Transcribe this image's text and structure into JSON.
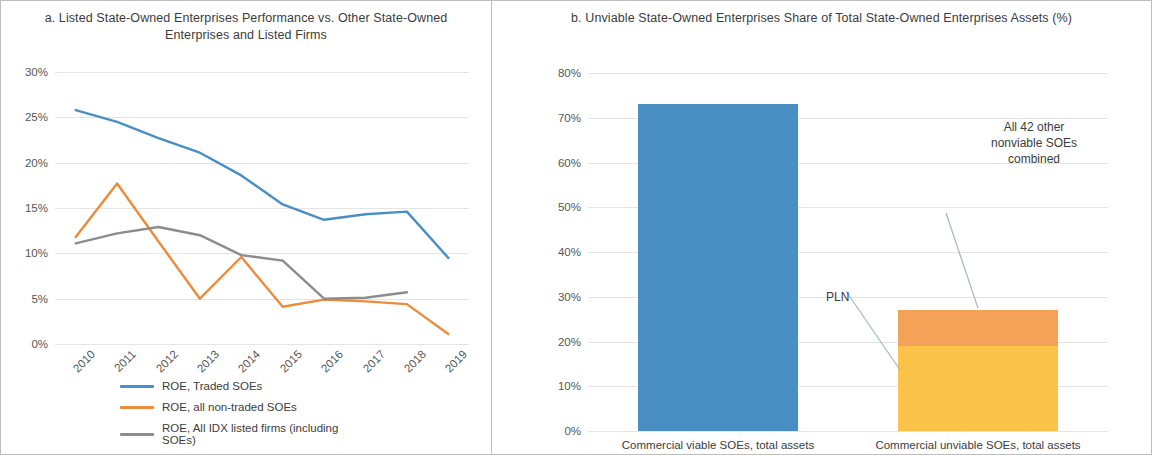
{
  "figure": {
    "panel_a_title": "a. Listed State-Owned Enterprises Performance vs. Other State-Owned Enterprises and Listed Firms",
    "panel_b_title": "b. Unviable State-Owned Enterprises Share of Total State-Owned Enterprises Assets (%)"
  },
  "colors": {
    "blue": "#4A8FC4",
    "orange": "#ED8B3C",
    "gray": "#8C8C8C",
    "bar_blue": "#4A8FC4",
    "bar_orange": "#F5A259",
    "bar_yellow": "#FBC34A",
    "gridline": "#E4E4E4",
    "border": "#BDBDBD",
    "text": "#3C3C3C"
  },
  "chart_data": [
    {
      "type": "line",
      "title": "a. Listed State-Owned Enterprises Performance vs. Other State-Owned Enterprises and Listed Firms",
      "xlabel": "",
      "ylabel": "",
      "ylim": [
        0,
        30
      ],
      "ytick_labels": [
        "0%",
        "5%",
        "10%",
        "15%",
        "20%",
        "25%",
        "30%"
      ],
      "ytick_values": [
        0,
        5,
        10,
        15,
        20,
        25,
        30
      ],
      "grid": true,
      "legend_position": "bottom",
      "categories": [
        "2010",
        "2011",
        "2012",
        "2013",
        "2014",
        "2015",
        "2016",
        "2017",
        "2018",
        "2019"
      ],
      "series": [
        {
          "name": "ROE, Traded SOEs",
          "color": "#4A8FC4",
          "values": [
            25.8,
            24.5,
            22.7,
            21.1,
            18.6,
            15.4,
            13.7,
            14.3,
            14.6,
            9.5
          ]
        },
        {
          "name": "ROE, all non-traded SOEs",
          "color": "#ED8B3C",
          "values": [
            11.8,
            17.7,
            11.3,
            5.0,
            9.6,
            4.1,
            4.9,
            4.7,
            4.4,
            1.1
          ]
        },
        {
          "name": "ROE, All IDX listed firms (including SOEs)",
          "color": "#8C8C8C",
          "values": [
            11.1,
            12.2,
            12.9,
            12.0,
            9.8,
            9.2,
            5.0,
            5.1,
            5.7,
            null
          ]
        }
      ]
    },
    {
      "type": "bar",
      "title": "b. Unviable State-Owned Enterprises Share of Total State-Owned Enterprises Assets (%)",
      "xlabel": "",
      "ylabel": "",
      "ylim": [
        0,
        80
      ],
      "ytick_labels": [
        "0%",
        "10%",
        "20%",
        "30%",
        "40%",
        "50%",
        "60%",
        "70%",
        "80%"
      ],
      "ytick_values": [
        0,
        10,
        20,
        30,
        40,
        50,
        60,
        70,
        80
      ],
      "grid": true,
      "stacked": true,
      "categories": [
        "Commercial viable SOEs, total assets",
        "Commercial unviable SOEs, total assets"
      ],
      "series": [
        {
          "name": "Commercial viable SOEs",
          "color": "#4A8FC4",
          "values": [
            73.0,
            0
          ]
        },
        {
          "name": "PLN",
          "color": "#FBC34A",
          "values": [
            0,
            19.0
          ]
        },
        {
          "name": "All 42 other nonviable SOEs combined",
          "color": "#F5A259",
          "values": [
            0,
            8.0
          ]
        }
      ],
      "annotations": [
        {
          "text": "PLN",
          "target": "pln-segment"
        },
        {
          "text": "All 42 other\nnonviable SOEs\ncombined",
          "target": "other-nonviable-segment"
        }
      ]
    }
  ],
  "panel_a": {
    "ytick_labels": [
      "30%",
      "25%",
      "20%",
      "15%",
      "10%",
      "5%",
      "0%"
    ],
    "xtick_labels": [
      "2010",
      "2011",
      "2012",
      "2013",
      "2014",
      "2015",
      "2016",
      "2017",
      "2018",
      "2019"
    ],
    "legend": [
      {
        "label": "ROE, Traded SOEs",
        "color": "#4A8FC4"
      },
      {
        "label": "ROE, all non-traded SOEs",
        "color": "#ED8B3C"
      },
      {
        "label": "ROE, All IDX listed firms (including SOEs)",
        "color": "#8C8C8C"
      }
    ]
  },
  "panel_b": {
    "ytick_labels": [
      "80%",
      "70%",
      "60%",
      "50%",
      "40%",
      "30%",
      "20%",
      "10%",
      "0%"
    ],
    "xtick_labels": [
      "Commercial viable SOEs, total assets",
      "Commercial unviable SOEs, total assets"
    ],
    "annotation_pln": "PLN",
    "annotation_other": "All 42 other\nnonviable SOEs\ncombined"
  }
}
